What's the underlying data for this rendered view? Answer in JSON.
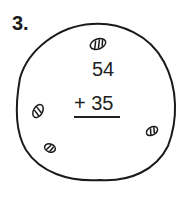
{
  "problem_number": "3.",
  "problem": {
    "addend_top": "54",
    "operator": "+",
    "addend_bottom": "35",
    "bottom_line": "+ 35"
  },
  "illustration": {
    "shape": "cookie-circle",
    "chips": 4,
    "stroke_color": "#1a1a1a"
  }
}
